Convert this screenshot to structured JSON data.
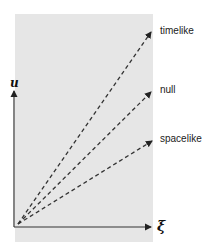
{
  "diagram": {
    "axes": {
      "vertical_label": "u",
      "horizontal_label": "ξ"
    },
    "lines": [
      {
        "name": "timelike",
        "label": "timelike",
        "style": "dashed",
        "end": [
          153,
          30
        ]
      },
      {
        "name": "null",
        "label": "null",
        "style": "dashed",
        "end": [
          153,
          90
        ]
      },
      {
        "name": "spacelike",
        "label": "spacelike",
        "style": "dashed",
        "end": [
          154,
          140
        ]
      }
    ],
    "colors": {
      "panel": "#e6e6e6",
      "ink": "#333333"
    }
  }
}
